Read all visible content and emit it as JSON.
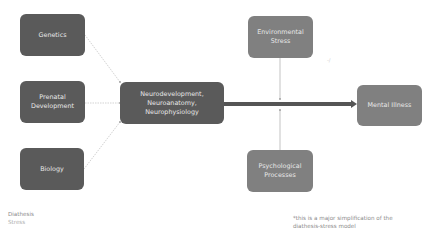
{
  "diagram": {
    "nodes": {
      "genetics": {
        "label": "Genetics"
      },
      "prenatal": {
        "label": "Prenatal Development"
      },
      "biology": {
        "label": "Biology"
      },
      "neuro": {
        "line1": "Neurodevelopment,",
        "line2": "Neuroanatomy,",
        "line3": "Neurophysiology"
      },
      "environmental": {
        "label": "Environmental Stress"
      },
      "psychological": {
        "label": "Psychological Processes"
      },
      "mental_illness": {
        "label": "Mental Illness"
      }
    },
    "edges": [
      {
        "from": "genetics",
        "to": "neuro",
        "style": "dotted"
      },
      {
        "from": "prenatal",
        "to": "neuro",
        "style": "dotted"
      },
      {
        "from": "biology",
        "to": "neuro",
        "style": "dotted"
      },
      {
        "from": "neuro",
        "to": "mental_illness",
        "style": "thick-arrow"
      },
      {
        "from": "environmental",
        "to": "main-arrow",
        "style": "thin"
      },
      {
        "from": "psychological",
        "to": "main-arrow",
        "style": "thin"
      }
    ],
    "legend": {
      "line1": "Diathesis",
      "line2": "Stress"
    },
    "footnote": {
      "line1": "*this is a major simplification of the",
      "line2": "diathesis-stress model"
    },
    "colors": {
      "diathesis_box": "#5a5a5a",
      "stress_box": "#808080",
      "main_arrow": "#555555",
      "box_text": "#e8e8e8"
    }
  }
}
